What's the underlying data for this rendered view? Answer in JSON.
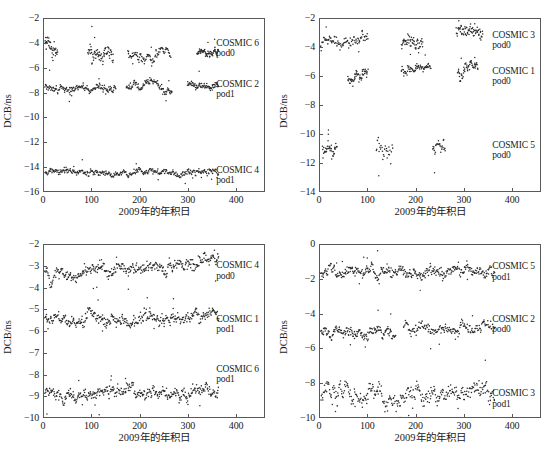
{
  "figure": {
    "background": "#ffffff",
    "marker_color": "#2b2b2b",
    "axis_color": "#595959"
  },
  "chart_data": [
    {
      "panel": "top-left",
      "type": "scatter",
      "title": "",
      "xlabel": "2009年的年积日",
      "ylabel": "DCB/ns",
      "xlim": [
        0,
        460
      ],
      "ylim": [
        -16,
        -2
      ],
      "xticks": [
        0,
        100,
        200,
        300,
        400
      ],
      "yticks": [
        -2,
        -4,
        -6,
        -8,
        -10,
        -12,
        -14,
        -16
      ],
      "grid": false,
      "legend": "in-plot-right",
      "series": [
        {
          "name": "COSMIC 6",
          "pod": "pod0",
          "label_x": 0.78,
          "label_y": -3.6,
          "mean": -4.7,
          "scatter": 0.28,
          "n": 290,
          "segments": [
            {
              "x0": 2,
              "x1": 28,
              "level": -3.85,
              "slope": -0.035,
              "noise": 0.45,
              "n": 42
            },
            {
              "x0": 92,
              "x1": 145,
              "level": -4.75,
              "slope": -0.004,
              "noise": 0.5,
              "n": 70
            },
            {
              "x0": 175,
              "x1": 265,
              "level": -4.85,
              "slope": 0.0,
              "noise": 0.3,
              "n": 88
            },
            {
              "x0": 320,
              "x1": 365,
              "level": -4.72,
              "slope": 0.0,
              "noise": 0.22,
              "n": 70
            }
          ]
        },
        {
          "name": "COSMIC 2",
          "pod": "pod1",
          "label_x": 0.78,
          "label_y": -6.9,
          "mean": -7.6,
          "scatter": 0.2,
          "n": 330,
          "segments": [
            {
              "x0": 2,
              "x1": 150,
              "level": -7.7,
              "slope": 0.0,
              "noise": 0.22,
              "n": 150
            },
            {
              "x0": 172,
              "x1": 268,
              "level": -7.5,
              "slope": 0.0,
              "noise": 0.25,
              "n": 100
            },
            {
              "x0": 300,
              "x1": 365,
              "level": -7.3,
              "slope": 0.0,
              "noise": 0.22,
              "n": 80
            }
          ]
        },
        {
          "name": "COSMIC 4",
          "pod": "pod1",
          "label_x": 0.78,
          "label_y": -13.8,
          "mean": -14.5,
          "scatter": 0.2,
          "n": 340,
          "segments": [
            {
              "x0": 2,
              "x1": 365,
              "level": -14.5,
              "slope": 0.0,
              "noise": 0.22,
              "n": 340
            }
          ]
        }
      ]
    },
    {
      "panel": "top-right",
      "type": "scatter",
      "title": "",
      "xlabel": "2009年的年积日",
      "ylabel": "DCB/ns",
      "xlim": [
        0,
        460
      ],
      "ylim": [
        -14,
        -2
      ],
      "xticks": [
        0,
        100,
        200,
        300,
        400
      ],
      "yticks": [
        -2,
        -4,
        -6,
        -8,
        -10,
        -12,
        -14
      ],
      "grid": false,
      "legend": "in-plot-right",
      "series": [
        {
          "name": "COSMIC 3",
          "pod": "pod0",
          "label_x": 0.78,
          "label_y": -2.8,
          "mean": -3.5,
          "scatter": 0.3,
          "n": 260,
          "segments": [
            {
              "x0": 2,
              "x1": 100,
              "level": -3.75,
              "slope": 0.0015,
              "noise": 0.3,
              "n": 90
            },
            {
              "x0": 170,
              "x1": 215,
              "level": -3.5,
              "slope": 0.0,
              "noise": 0.35,
              "n": 55
            },
            {
              "x0": 285,
              "x1": 340,
              "level": -2.7,
              "slope": 0.0,
              "noise": 0.4,
              "n": 70
            }
          ]
        },
        {
          "name": "COSMIC 1",
          "pod": "pod0",
          "label_x": 0.78,
          "label_y": -5.3,
          "mean": -5.8,
          "scatter": 0.3,
          "n": 180,
          "segments": [
            {
              "x0": 58,
              "x1": 100,
              "level": -6.25,
              "slope": 0.004,
              "noise": 0.3,
              "n": 55
            },
            {
              "x0": 170,
              "x1": 232,
              "level": -5.5,
              "slope": 0.0,
              "noise": 0.25,
              "n": 65
            },
            {
              "x0": 288,
              "x1": 330,
              "level": -5.6,
              "slope": 0.0,
              "noise": 0.35,
              "n": 55
            }
          ]
        },
        {
          "name": "COSMIC 5",
          "pod": "pod0",
          "label_x": 0.78,
          "label_y": -10.4,
          "mean": -11.2,
          "scatter": 0.5,
          "n": 95,
          "segments": [
            {
              "x0": 5,
              "x1": 35,
              "level": -11.15,
              "slope": 0.0,
              "noise": 0.45,
              "n": 40
            },
            {
              "x0": 118,
              "x1": 152,
              "level": -11.4,
              "slope": 0.0,
              "noise": 0.55,
              "n": 28
            },
            {
              "x0": 235,
              "x1": 262,
              "level": -11.0,
              "slope": 0.0,
              "noise": 0.5,
              "n": 27
            }
          ]
        }
      ]
    },
    {
      "panel": "bottom-left",
      "type": "scatter",
      "title": "",
      "xlabel": "2009年的年积日",
      "ylabel": "DCB/ns",
      "xlim": [
        0,
        460
      ],
      "ylim": [
        -10,
        -2
      ],
      "xticks": [
        0,
        100,
        200,
        300,
        400
      ],
      "yticks": [
        -2,
        -3,
        -4,
        -5,
        -6,
        -7,
        -8,
        -9,
        -10
      ],
      "grid": false,
      "legend": "in-plot-right",
      "series": [
        {
          "name": "COSMIC 4",
          "pod": "pod0",
          "label_x": 0.78,
          "label_y": -2.75,
          "mean": -3.2,
          "scatter": 0.2,
          "n": 360,
          "segments": [
            {
              "x0": 2,
              "x1": 365,
              "level": -3.2,
              "slope": 0.0008,
              "noise": 0.22,
              "n": 360
            }
          ]
        },
        {
          "name": "COSMIC 1",
          "pod": "pod1",
          "label_x": 0.78,
          "label_y": -5.2,
          "mean": -5.5,
          "scatter": 0.2,
          "n": 360,
          "segments": [
            {
              "x0": 2,
              "x1": 365,
              "level": -5.5,
              "slope": 0.0004,
              "noise": 0.2,
              "n": 360
            }
          ]
        },
        {
          "name": "COSMIC 6",
          "pod": "pod1",
          "label_x": 0.78,
          "label_y": -7.5,
          "mean": -9.0,
          "scatter": 0.2,
          "n": 360,
          "segments": [
            {
              "x0": 2,
              "x1": 365,
              "level": -9.0,
              "slope": 0.0006,
              "noise": 0.22,
              "n": 360
            }
          ]
        }
      ]
    },
    {
      "panel": "bottom-right",
      "type": "scatter",
      "title": "",
      "xlabel": "2009年的年积日",
      "ylabel": "DCB/ns",
      "xlim": [
        0,
        460
      ],
      "ylim": [
        -10,
        0
      ],
      "xticks": [
        0,
        100,
        200,
        300,
        400
      ],
      "yticks": [
        0,
        -2,
        -4,
        -6,
        -8,
        -10
      ],
      "grid": false,
      "legend": "in-plot-right",
      "series": [
        {
          "name": "COSMIC 5",
          "pod": "pod1",
          "label_x": 0.78,
          "label_y": -1.0,
          "mean": -1.6,
          "scatter": 0.22,
          "n": 360,
          "segments": [
            {
              "x0": 2,
              "x1": 365,
              "level": -1.65,
              "slope": 0.0005,
              "noise": 0.25,
              "n": 360
            }
          ]
        },
        {
          "name": "COSMIC 2",
          "pod": "pod0",
          "label_x": 0.78,
          "label_y": -4.0,
          "mean": -5.0,
          "scatter": 0.22,
          "n": 330,
          "segments": [
            {
              "x0": 2,
              "x1": 158,
              "level": -5.05,
              "slope": 0.0,
              "noise": 0.25,
              "n": 160
            },
            {
              "x0": 175,
              "x1": 365,
              "level": -4.9,
              "slope": 0.0004,
              "noise": 0.25,
              "n": 170
            }
          ]
        },
        {
          "name": "COSMIC 3",
          "pod": "pod1",
          "label_x": 0.78,
          "label_y": -8.3,
          "mean": -8.9,
          "scatter": 0.4,
          "n": 330,
          "segments": [
            {
              "x0": 2,
              "x1": 365,
              "level": -8.95,
              "slope": 0.0008,
              "noise": 0.42,
              "n": 330
            }
          ]
        }
      ]
    }
  ]
}
